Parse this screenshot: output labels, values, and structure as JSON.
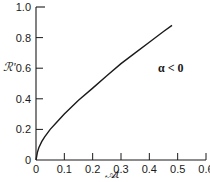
{
  "chart_data": {
    "type": "line",
    "title": "",
    "xlabel": "𝒜t",
    "ylabel": "ℛ'",
    "xlim": [
      0,
      0.6
    ],
    "ylim": [
      0,
      1.0
    ],
    "grid": false,
    "legend": null,
    "x_ticks": [
      "0",
      "0.1",
      "0.2",
      "0.3",
      "0.4",
      "0.5",
      "0.6"
    ],
    "y_ticks": [
      "0",
      "0.2",
      "0.4",
      "0.6",
      "0.8",
      "1.0"
    ],
    "annotations": [
      {
        "text": "α < 0",
        "x": 0.52,
        "y": 0.55
      }
    ],
    "series": [
      {
        "name": "α < 0",
        "x": [
          0,
          0.005,
          0.01,
          0.02,
          0.03,
          0.05,
          0.07,
          0.1,
          0.15,
          0.2,
          0.25,
          0.3,
          0.35,
          0.4,
          0.45,
          0.48
        ],
        "y": [
          0,
          0.05,
          0.08,
          0.12,
          0.15,
          0.2,
          0.24,
          0.3,
          0.39,
          0.47,
          0.55,
          0.63,
          0.7,
          0.77,
          0.84,
          0.88
        ]
      }
    ]
  }
}
